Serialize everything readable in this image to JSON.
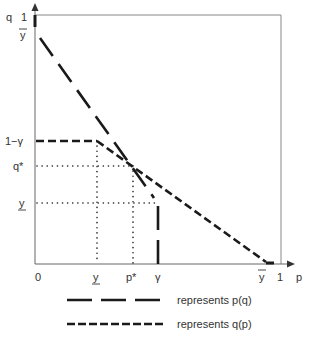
{
  "diagram": {
    "type": "economic-curve-diagram",
    "axes": {
      "y_axis_label": "q",
      "x_axis_label": "p",
      "y_ticks": [
        {
          "label": "1",
          "y": 17
        },
        {
          "label": "ȳ",
          "y": 38
        },
        {
          "label": "1−γ",
          "y": 141
        },
        {
          "label": "q*",
          "y": 166
        },
        {
          "label": "y",
          "y": 203,
          "underline": true
        }
      ],
      "x_ticks": [
        {
          "label": "0",
          "x": 35
        },
        {
          "label": "y",
          "x": 97,
          "underline": true
        },
        {
          "label": "p*",
          "x": 133
        },
        {
          "label": "γ",
          "x": 158
        },
        {
          "label": "ȳ",
          "x": 264
        },
        {
          "label": "1",
          "x": 281
        }
      ]
    },
    "curves": [
      {
        "name": "p(q)",
        "style": "long-dash",
        "color": "#1a1a1a"
      },
      {
        "name": "q(p)",
        "style": "short-dash",
        "color": "#1a1a1a"
      }
    ],
    "legend": [
      {
        "style": "long-dash",
        "label": "represents p(q)"
      },
      {
        "style": "short-dash",
        "label": "represents q(p)"
      }
    ],
    "guides": [
      {
        "from": "q*",
        "to": "p*",
        "style": "dotted"
      },
      {
        "from": "y (underlined, q-axis)",
        "to": "γ",
        "style": "dotted"
      },
      {
        "from": "y (underlined, p-axis)",
        "to": "1−γ",
        "style": "dotted"
      }
    ]
  },
  "labels": {
    "q": "q",
    "p": "p",
    "one_top": "1",
    "ybar_q": "ȳ",
    "one_minus_gamma": "1−γ",
    "qstar": "q*",
    "yunder_q": "y",
    "zero": "0",
    "yunder_p": "y",
    "pstar": "p*",
    "gamma": "γ",
    "ybar_p": "y",
    "one_right": "1"
  },
  "legend": {
    "pq_label": "represents p(q)",
    "qp_label": "represents q(p)"
  }
}
